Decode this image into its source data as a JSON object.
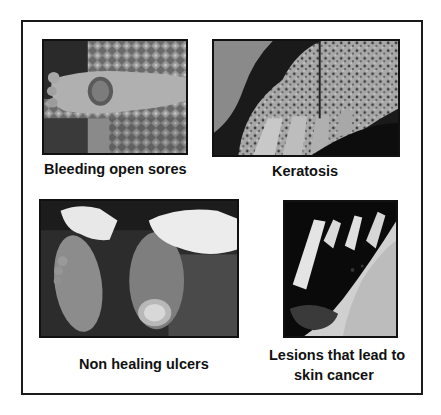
{
  "figure": {
    "panels": [
      {
        "id": "sores",
        "image": "foot-with-open-sore-photo",
        "caption": "Bleeding open sores"
      },
      {
        "id": "keratosis",
        "image": "hands-with-keratosis-photo",
        "caption": "Keratosis"
      },
      {
        "id": "ulcers",
        "image": "soles-with-ulcers-photo",
        "caption": "Non healing ulcers"
      },
      {
        "id": "lesions",
        "image": "hand-with-cancerous-lesion-photo",
        "caption_line1": "Lesions that lead to",
        "caption_line2": "skin cancer"
      }
    ]
  }
}
